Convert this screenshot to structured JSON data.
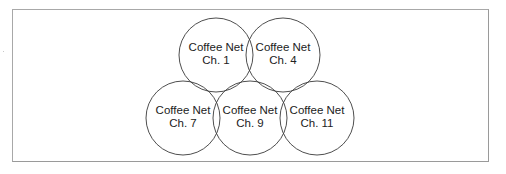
{
  "diagram": {
    "title": "",
    "cells": [
      {
        "name": "Coffee Net",
        "channel": "Ch. 1",
        "cx": 216,
        "cy": 55,
        "r": 37
      },
      {
        "name": "Coffee Net",
        "channel": "Ch. 4",
        "cx": 283,
        "cy": 55,
        "r": 37
      },
      {
        "name": "Coffee Net",
        "channel": "Ch. 7",
        "cx": 183,
        "cy": 118,
        "r": 37
      },
      {
        "name": "Coffee Net",
        "channel": "Ch. 9",
        "cx": 250,
        "cy": 118,
        "r": 37
      },
      {
        "name": "Coffee Net",
        "channel": "Ch. 11",
        "cx": 317,
        "cy": 118,
        "r": 37
      }
    ],
    "colors": {
      "circle_stroke": "#3a3a3a",
      "text": "#222222",
      "frame_border": "#a8a8a8",
      "background": "#ffffff"
    }
  }
}
